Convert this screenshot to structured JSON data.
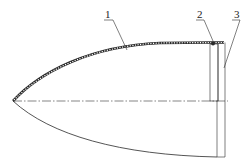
{
  "diagram": {
    "type": "technical-cross-section",
    "labels": [
      {
        "id": "1",
        "text": "1",
        "refers_to": "shell"
      },
      {
        "id": "2",
        "text": "2",
        "refers_to": "joint"
      },
      {
        "id": "3",
        "text": "3",
        "refers_to": "end-ring"
      }
    ],
    "colors": {
      "line": "#2a2a2a",
      "background": "#ffffff"
    }
  }
}
